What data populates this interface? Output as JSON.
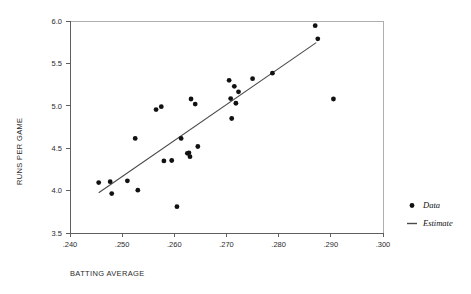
{
  "chart_data": {
    "type": "scatter",
    "title": "",
    "xlabel": "BATTING AVERAGE",
    "ylabel": "RUNS PER GAME",
    "xlim": [
      0.24,
      0.3
    ],
    "ylim": [
      3.5,
      6.0
    ],
    "grid": false,
    "legend_position": "right",
    "x_ticks": [
      ".240",
      ".250",
      ".260",
      ".270",
      ".280",
      ".290",
      ".300"
    ],
    "x_tick_values": [
      0.24,
      0.25,
      0.26,
      0.27,
      0.28,
      0.29,
      0.3
    ],
    "y_ticks": [
      "6.0",
      "5.5",
      "5.0",
      "4.5",
      "4.0",
      "3.5"
    ],
    "y_tick_values": [
      6.0,
      5.5,
      5.0,
      4.5,
      4.0,
      3.5
    ],
    "series": [
      {
        "name": "Data",
        "type": "scatter",
        "marker": "circle",
        "color": "#111111",
        "points": [
          [
            0.2455,
            4.095
          ],
          [
            0.2477,
            4.105
          ],
          [
            0.248,
            3.965
          ],
          [
            0.251,
            4.115
          ],
          [
            0.2525,
            4.615
          ],
          [
            0.253,
            4.005
          ],
          [
            0.2565,
            4.955
          ],
          [
            0.2575,
            4.99
          ],
          [
            0.258,
            4.35
          ],
          [
            0.2595,
            4.355
          ],
          [
            0.2605,
            3.81
          ],
          [
            0.2613,
            4.615
          ],
          [
            0.2625,
            4.44
          ],
          [
            0.2628,
            4.445
          ],
          [
            0.263,
            4.4
          ],
          [
            0.2632,
            5.08
          ],
          [
            0.264,
            5.02
          ],
          [
            0.2645,
            4.52
          ],
          [
            0.2705,
            5.3
          ],
          [
            0.2708,
            5.085
          ],
          [
            0.271,
            4.85
          ],
          [
            0.2715,
            5.23
          ],
          [
            0.2718,
            5.03
          ],
          [
            0.2723,
            5.165
          ],
          [
            0.275,
            5.32
          ],
          [
            0.2788,
            5.385
          ],
          [
            0.287,
            5.945
          ],
          [
            0.2875,
            5.79
          ],
          [
            0.2905,
            5.08
          ]
        ]
      },
      {
        "name": "Estimate",
        "type": "line",
        "color": "#4a4a4a",
        "endpoints": [
          [
            0.2455,
            3.975
          ],
          [
            0.2872,
            5.745
          ]
        ]
      }
    ],
    "legend": [
      {
        "label": "Data",
        "marker": "circle"
      },
      {
        "label": "Estimate",
        "marker": "line"
      }
    ]
  }
}
